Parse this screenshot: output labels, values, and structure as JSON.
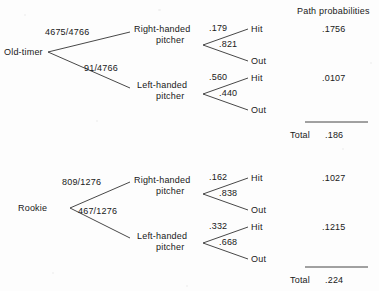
{
  "header": {
    "path_probabilities_label": "Path probabilities"
  },
  "trees": [
    {
      "root_label": "Old-timer",
      "branches": [
        {
          "fraction": "4675/4766",
          "node_line1": "Right-handed",
          "node_line2": "pitcher",
          "outcomes": [
            {
              "prob": ".179",
              "label": "Hit"
            },
            {
              "prob": ".821",
              "label": "Out"
            }
          ],
          "path_probability": ".1756"
        },
        {
          "fraction": "91/4766",
          "node_line1": "Left-handed",
          "node_line2": "pitcher",
          "outcomes": [
            {
              "prob": ".560",
              "label": "Hit"
            },
            {
              "prob": ".440",
              "label": "Out"
            }
          ],
          "path_probability": ".0107"
        }
      ],
      "total_label": "Total",
      "total_value": ".186"
    },
    {
      "root_label": "Rookie",
      "branches": [
        {
          "fraction": "809/1276",
          "node_line1": "Right-handed",
          "node_line2": "pitcher",
          "outcomes": [
            {
              "prob": ".162",
              "label": "Hit"
            },
            {
              "prob": ".838",
              "label": "Out"
            }
          ],
          "path_probability": ".1027"
        },
        {
          "fraction": "467/1276",
          "node_line1": "Left-handed",
          "node_line2": "pitcher",
          "outcomes": [
            {
              "prob": ".332",
              "label": "Hit"
            },
            {
              "prob": ".668",
              "label": "Out"
            }
          ],
          "path_probability": ".1215"
        }
      ],
      "total_label": "Total",
      "total_value": ".224"
    }
  ],
  "colors": {
    "background": "#fdfdfd",
    "ink": "#202020",
    "line": "#333333"
  }
}
